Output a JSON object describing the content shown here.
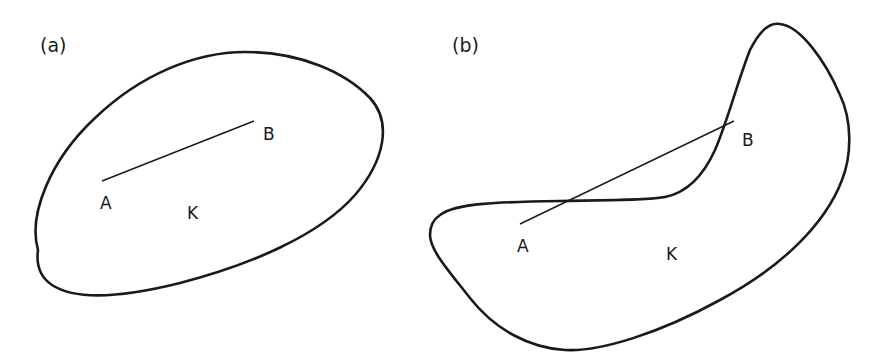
{
  "figure": {
    "panels": [
      {
        "id": "a",
        "panel_label": "(a)",
        "set_label": "K",
        "point_a_label": "A",
        "point_b_label": "B",
        "convex": true,
        "segment_inside_set": true
      },
      {
        "id": "b",
        "panel_label": "(b)",
        "set_label": "K",
        "point_a_label": "A",
        "point_b_label": "B",
        "convex": false,
        "segment_inside_set": false
      }
    ],
    "colors": {
      "stroke": "#1a1a1a",
      "background": "#ffffff"
    }
  }
}
